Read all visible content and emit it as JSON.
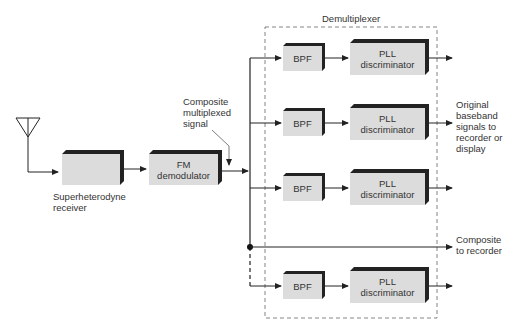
{
  "diagram": {
    "title": "Demultiplexer",
    "colors": {
      "box_fill": "#dcdcdc",
      "box_shadow": "#222222",
      "line": "#222222",
      "dashed": "#666666"
    },
    "blocks": {
      "antenna": {
        "icon": "antenna-icon"
      },
      "receiver": {
        "label": "",
        "caption": "Superheterodyne\nreceiver"
      },
      "fm_demod": {
        "label": "FM\ndemodulator"
      }
    },
    "annotations": {
      "composite_signal": "Composite\nmultiplexed\nsignal",
      "outputs": "Original\nbaseband\nsignals to\nrecorder or\ndisplay",
      "composite_recorder": "Composite\nto recorder"
    },
    "channels": [
      {
        "bpf": "BPF",
        "pll": "PLL\ndiscriminator"
      },
      {
        "bpf": "BPF",
        "pll": "PLL\ndiscriminator"
      },
      {
        "bpf": "BPF",
        "pll": "PLL\ndiscriminator"
      },
      {
        "bpf": "BPF",
        "pll": "PLL\ndiscriminator"
      }
    ]
  }
}
